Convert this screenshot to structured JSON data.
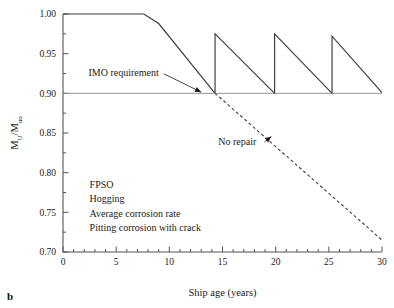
{
  "panel": {
    "letter": "b"
  },
  "chart_data": {
    "type": "line",
    "title": "",
    "xlabel": "Ship age (years)",
    "ylabel": "M_U/M_uo",
    "ylabel_parts": {
      "main1": "M",
      "sub1": "U",
      "slash": "/",
      "main2": "M",
      "sub2": "uo"
    },
    "xlim": [
      0,
      30
    ],
    "ylim": [
      0.7,
      1.0
    ],
    "xticks": [
      0,
      5,
      10,
      15,
      20,
      25,
      30
    ],
    "xticklabels": [
      "0",
      "5",
      "10",
      "15",
      "20",
      "25",
      "30"
    ],
    "x_minor_step": 1,
    "yticks": [
      0.7,
      0.75,
      0.8,
      0.85,
      0.9,
      0.95,
      1.0
    ],
    "yticklabels": [
      "0.70",
      "0.75",
      "0.80",
      "0.85",
      "0.90",
      "0.95",
      "1.00"
    ],
    "y_minor_step": 0.025,
    "grid": false,
    "legend_position": "none",
    "series": [
      {
        "name": "With repair",
        "style": "solid",
        "color": "#3a3a3a",
        "points": [
          [
            0.0,
            1.0
          ],
          [
            7.6,
            1.0
          ],
          [
            9.0,
            0.988
          ],
          [
            14.3,
            0.9
          ],
          [
            14.3,
            0.975
          ],
          [
            19.9,
            0.9
          ],
          [
            19.9,
            0.975
          ],
          [
            25.3,
            0.9
          ],
          [
            25.3,
            0.972
          ],
          [
            30.0,
            0.901
          ]
        ]
      },
      {
        "name": "No repair",
        "style": "dashed",
        "color": "#3a3a3a",
        "points": [
          [
            14.3,
            0.9
          ],
          [
            30.0,
            0.715
          ]
        ]
      },
      {
        "name": "IMO requirement",
        "style": "solid-thin",
        "color": "#8a8a8a",
        "points": [
          [
            0.0,
            0.9
          ],
          [
            30.0,
            0.9
          ]
        ]
      }
    ],
    "annotations": [
      {
        "id": "imo",
        "text": "IMO requirement",
        "text_x": 2.4,
        "text_y": 0.9215,
        "arrow_to_x": 13.0,
        "arrow_to_y": 0.9015
      },
      {
        "id": "norepair",
        "text": "No repair",
        "text_x": 14.6,
        "text_y": 0.8355,
        "arrow_to_x": 19.6,
        "arrow_to_y": 0.8455
      }
    ],
    "legend_block": {
      "x": 2.5,
      "y_start": 0.7805,
      "lines": [
        "FPSO",
        "Hogging",
        "Average corrosion rate",
        "Pitting corrosion with crack"
      ]
    }
  }
}
